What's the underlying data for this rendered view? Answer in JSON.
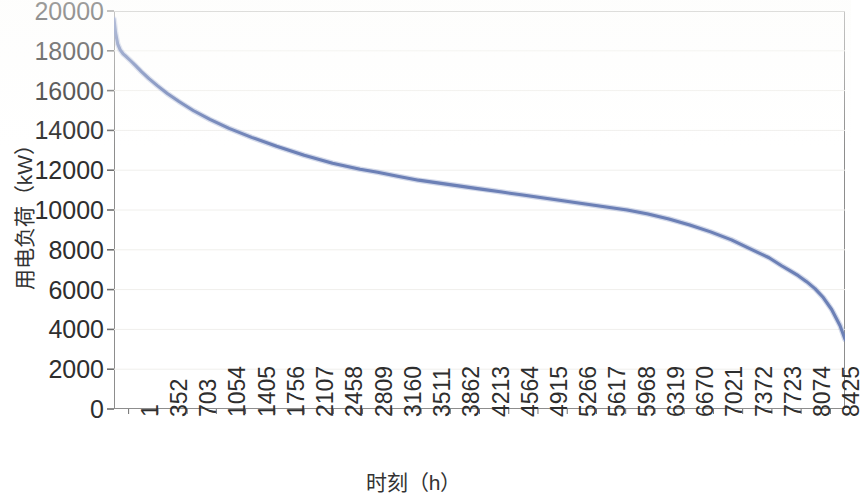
{
  "chart_data": {
    "type": "line",
    "title": "",
    "xlabel": "时刻（h）",
    "ylabel": "用电负荷（kW）",
    "xlim": [
      1,
      8760
    ],
    "ylim": [
      0,
      20000
    ],
    "grid": true,
    "legend": null,
    "line_color": "#6C80B6",
    "x_tick_labels": [
      "1",
      "352",
      "703",
      "1054",
      "1405",
      "1756",
      "2107",
      "2458",
      "2809",
      "3160",
      "3511",
      "3862",
      "4213",
      "4564",
      "4915",
      "5266",
      "5617",
      "5968",
      "6319",
      "6670",
      "7021",
      "7372",
      "7723",
      "8074",
      "8425"
    ],
    "y_tick_labels": [
      "0",
      "2000",
      "4000",
      "6000",
      "8000",
      "10000",
      "12000",
      "14000",
      "16000",
      "18000",
      "20000"
    ],
    "y_tick_values": [
      0,
      2000,
      4000,
      6000,
      8000,
      10000,
      12000,
      14000,
      16000,
      18000,
      20000
    ],
    "series": [
      {
        "name": "用电负荷",
        "x": [
          1,
          20,
          45,
          75,
          110,
          150,
          200,
          260,
          330,
          420,
          520,
          640,
          780,
          950,
          1150,
          1380,
          1650,
          1950,
          2280,
          2620,
          2950,
          3160,
          3400,
          3650,
          3900,
          4150,
          4400,
          4650,
          4900,
          5150,
          5400,
          5650,
          5900,
          6150,
          6400,
          6650,
          6900,
          7150,
          7400,
          7650,
          7850,
          8000,
          8100,
          8200,
          8300,
          8400,
          8500,
          8600,
          8700,
          8760
        ],
        "y": [
          19600,
          18900,
          18350,
          18050,
          17850,
          17700,
          17500,
          17250,
          16950,
          16600,
          16250,
          15850,
          15450,
          15000,
          14550,
          14100,
          13650,
          13200,
          12750,
          12350,
          12050,
          11900,
          11700,
          11500,
          11350,
          11200,
          11050,
          10900,
          10750,
          10600,
          10450,
          10300,
          10150,
          10000,
          9800,
          9550,
          9250,
          8900,
          8500,
          8000,
          7600,
          7200,
          6950,
          6700,
          6400,
          6050,
          5600,
          5000,
          4200,
          3500
        ]
      }
    ]
  }
}
